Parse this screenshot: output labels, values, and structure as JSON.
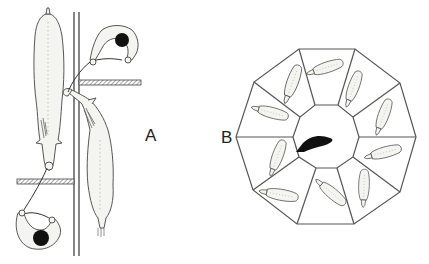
{
  "figure": {
    "panel_a": {
      "label": "A",
      "description": "Two workers leading cattle past posts and rails, top view"
    },
    "panel_b": {
      "label": "B",
      "description": "Decagonal pen with ten radial stalls each holding an animal; dark animal in central hub"
    }
  },
  "colors": {
    "line": "#555555",
    "fill": "#f4f4f0",
    "dark": "#111111",
    "background": "#ffffff"
  }
}
